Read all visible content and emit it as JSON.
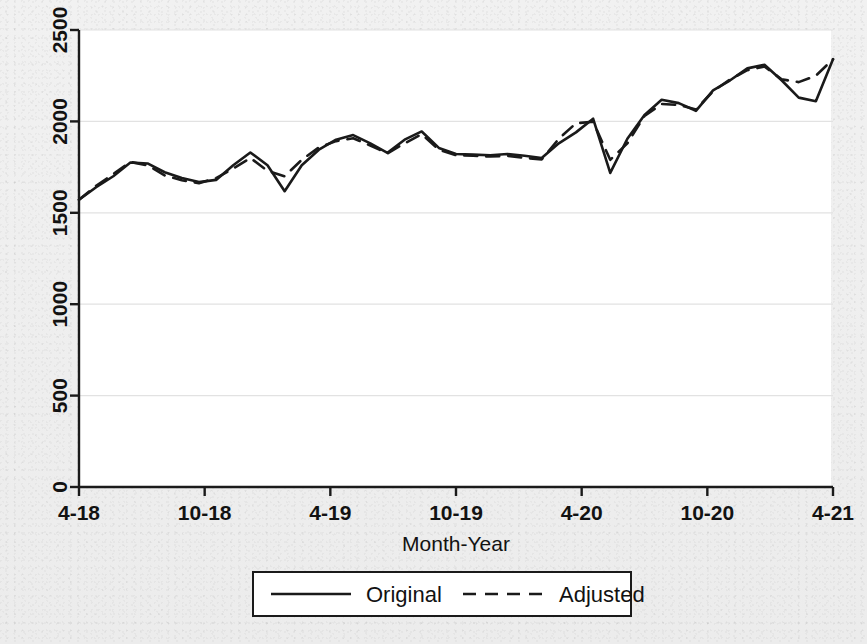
{
  "figure": {
    "background_color": "#efefef",
    "plot_background_color": "#ffffff",
    "line_color": "#1a1a1a",
    "grid_color": "#e2e2e2"
  },
  "chart_data": {
    "type": "line",
    "title": "",
    "subtitle": "",
    "xlabel": "Month-Year",
    "ylabel": "",
    "xlim": [
      0,
      36
    ],
    "ylim": [
      0,
      2500
    ],
    "yticks": [
      0,
      500,
      1000,
      1500,
      2000,
      2500
    ],
    "ytick_labels": [
      "0",
      "500",
      "1000",
      "1500",
      "2000",
      "2500"
    ],
    "xticks": [
      0,
      6,
      12,
      18,
      24,
      30,
      36
    ],
    "xtick_labels": [
      "4-18",
      "10-18",
      "4-19",
      "10-19",
      "4-20",
      "10-20",
      "4-21"
    ],
    "grid": true,
    "grid_axis": "y",
    "legend_position": "below-center",
    "legend_entries": [
      {
        "label": "Original",
        "style": "solid"
      },
      {
        "label": "Adjusted",
        "style": "dashed"
      }
    ],
    "x": [
      0,
      1,
      2,
      3,
      4,
      5,
      6,
      7,
      8,
      9,
      10,
      11,
      12,
      13,
      14,
      15,
      16,
      17,
      18,
      19,
      20,
      21,
      22,
      23,
      24,
      25,
      26,
      27,
      28,
      29,
      30,
      31,
      32,
      33,
      34,
      35,
      36
    ],
    "series": [
      {
        "name": "Original",
        "style": "solid",
        "values": [
          1572,
          1640,
          1700,
          1775,
          1770,
          1722,
          1690,
          1668,
          1680,
          1760,
          1830,
          1760,
          1618,
          1760,
          1845,
          1900,
          1925,
          1880,
          1828,
          1900,
          1860,
          1822,
          1818,
          1815,
          1822,
          1812,
          1800,
          1880,
          1940,
          2015,
          1718,
          1905,
          2035,
          2118,
          2100,
          2050,
          2000
        ]
      },
      {
        "name": "Adjusted",
        "style": "dashed",
        "values": [
          1572,
          1648,
          1712,
          1778,
          1760,
          1705,
          1678,
          1662,
          1690,
          1742,
          1800,
          1730,
          1700,
          1790,
          1858,
          1892,
          1908,
          1868,
          1825,
          1880,
          1855,
          1820,
          1812,
          1810,
          1815,
          1805,
          1788,
          1840,
          1960,
          1998,
          1790,
          1880,
          2030,
          2095,
          2090,
          2060,
          2010
        ]
      }
    ],
    "note": "Second half values continue rising; see series_full for the plotted path",
    "series_full": [
      {
        "name": "Original",
        "style": "solid",
        "values": [
          1572,
          1640,
          1700,
          1775,
          1770,
          1722,
          1690,
          1668,
          1680,
          1760,
          1830,
          1760,
          1618,
          1760,
          1845,
          1900,
          1925,
          1880,
          1828,
          1900,
          1945,
          1855,
          1822,
          1818,
          1815,
          1822,
          1812,
          1800,
          1880,
          1940,
          2015,
          1718,
          1905,
          2035,
          2118,
          2100,
          2058,
          2170,
          2225,
          2290,
          2310,
          2225,
          2130,
          2110,
          2340
        ]
      },
      {
        "name": "Adjusted",
        "style": "dashed",
        "values": [
          1572,
          1648,
          1712,
          1778,
          1760,
          1705,
          1678,
          1662,
          1690,
          1742,
          1800,
          1730,
          1700,
          1790,
          1858,
          1892,
          1908,
          1868,
          1825,
          1880,
          1930,
          1845,
          1815,
          1812,
          1808,
          1812,
          1800,
          1792,
          1905,
          1990,
          1998,
          1790,
          1880,
          2030,
          2095,
          2090,
          2065,
          2165,
          2230,
          2280,
          2300,
          2230,
          2215,
          2250,
          2340
        ]
      }
    ]
  }
}
